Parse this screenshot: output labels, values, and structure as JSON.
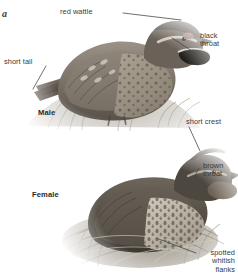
{
  "plate": {
    "letter": "a",
    "subject": "quail"
  },
  "sexes": [
    {
      "id": "male",
      "label": "Male"
    },
    {
      "id": "female",
      "label": "Female"
    }
  ],
  "callouts": [
    {
      "id": "red-wattle",
      "text": "red wattle",
      "align": "left"
    },
    {
      "id": "black-throat",
      "text": "black\nthroat",
      "align": "left"
    },
    {
      "id": "short-tail",
      "text": "short tail",
      "align": "left"
    },
    {
      "id": "short-crest",
      "text": "short crest",
      "align": "left"
    },
    {
      "id": "brown-throat",
      "text": "brown\nthroat",
      "align": "left"
    },
    {
      "id": "spotted-whitish-flanks",
      "text": "spotted\nwhitish\nflanks",
      "align": "right"
    }
  ],
  "colors": {
    "background": "#ffffff",
    "label_text": "#3b3b3b",
    "sex_text": "#2b2b2b",
    "leader_line": "#4a4a4a",
    "plumage_dark": "#4a443c",
    "plumage_mid": "#8b8378",
    "plumage_light": "#cfc8bc",
    "grass": "#b9b3a6"
  }
}
